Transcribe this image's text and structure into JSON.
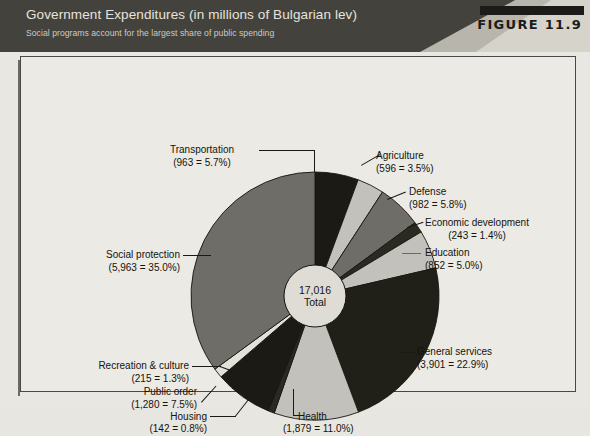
{
  "header": {
    "title": "Government Expenditures (in millions of Bulgarian lev)",
    "subtitle": "Social programs account for the largest share of public spending",
    "figure_tag": "FIGURE 11.9"
  },
  "center": {
    "total_value": "17,016",
    "total_word": "Total"
  },
  "labels": {
    "transportation": {
      "name": "Transportation",
      "detail": "(963 = 5.7%)"
    },
    "agriculture": {
      "name": "Agriculture",
      "detail": "(596 = 3.5%)"
    },
    "defense": {
      "name": "Defense",
      "detail": "(982 = 5.8%)"
    },
    "economic_development": {
      "name": "Economic development",
      "detail": "(243 = 1.4%)"
    },
    "education": {
      "name": "Education",
      "detail": "(852 = 5.0%)"
    },
    "general_services": {
      "name": "General services",
      "detail": "(3,901 = 22.9%)"
    },
    "health": {
      "name": "Health",
      "detail": "(1,879 = 11.0%)"
    },
    "housing": {
      "name": "Housing",
      "detail": "(142 = 0.8%)"
    },
    "public_order": {
      "name": "Public order",
      "detail": "(1,280 = 7.5%)"
    },
    "recreation_culture": {
      "name": "Recreation & culture",
      "detail": "(215 = 1.3%)"
    },
    "social_protection": {
      "name": "Social protection",
      "detail": "(5,963 = 35.0%)"
    }
  },
  "colors": {
    "header_bg": "#44423d",
    "panel_bg": "#eceae4",
    "slice_black": "#1b1a14",
    "slice_dark": "#2b2a22",
    "slice_mid_gray": "#6f6d68",
    "slice_light_gray": "#c3c1bb",
    "hub_fill": "#dedcd5",
    "outline": "#16150f"
  },
  "chart_data": {
    "type": "pie",
    "title": "Government Expenditures (in millions of Bulgarian lev)",
    "subtitle": "Social programs account for the largest share of public spending",
    "units": "millions of Bulgarian lev",
    "total": 17016,
    "total_label": "17,016 Total",
    "start_angle_deg": 0,
    "direction": "clockwise",
    "donut_hole": true,
    "legend": "callout-labels",
    "categories": [
      "Transportation",
      "Agriculture",
      "Defense",
      "Economic development",
      "Education",
      "General services",
      "Health",
      "Housing",
      "Public order",
      "Recreation & culture",
      "Social protection"
    ],
    "values": [
      963,
      596,
      982,
      243,
      852,
      3901,
      1879,
      142,
      1280,
      215,
      5963
    ],
    "percents": [
      5.7,
      3.5,
      5.8,
      1.4,
      5.0,
      22.9,
      11.0,
      0.8,
      7.5,
      1.3,
      35.0
    ],
    "slice_colors": [
      "#1b1a14",
      "#c3c1bb",
      "#6f6d68",
      "#2b2a22",
      "#c3c1bb",
      "#201f18",
      "#c3c1bb",
      "#2b2a22",
      "#1b1a14",
      "#e3e1da",
      "#6f6d68"
    ],
    "slices": [
      {
        "label": "Transportation",
        "value": 963,
        "percent": 5.7,
        "color": "#1b1a14"
      },
      {
        "label": "Agriculture",
        "value": 596,
        "percent": 3.5,
        "color": "#c3c1bb"
      },
      {
        "label": "Defense",
        "value": 982,
        "percent": 5.8,
        "color": "#6f6d68"
      },
      {
        "label": "Economic development",
        "value": 243,
        "percent": 1.4,
        "color": "#2b2a22"
      },
      {
        "label": "Education",
        "value": 852,
        "percent": 5.0,
        "color": "#c3c1bb"
      },
      {
        "label": "General services",
        "value": 3901,
        "percent": 22.9,
        "color": "#201f18"
      },
      {
        "label": "Health",
        "value": 1879,
        "percent": 11.0,
        "color": "#c3c1bb"
      },
      {
        "label": "Housing",
        "value": 142,
        "percent": 0.8,
        "color": "#2b2a22"
      },
      {
        "label": "Public order",
        "value": 1280,
        "percent": 7.5,
        "color": "#1b1a14"
      },
      {
        "label": "Recreation & culture",
        "value": 215,
        "percent": 1.3,
        "color": "#e3e1da"
      },
      {
        "label": "Social protection",
        "value": 5963,
        "percent": 35.0,
        "color": "#6f6d68"
      }
    ]
  }
}
